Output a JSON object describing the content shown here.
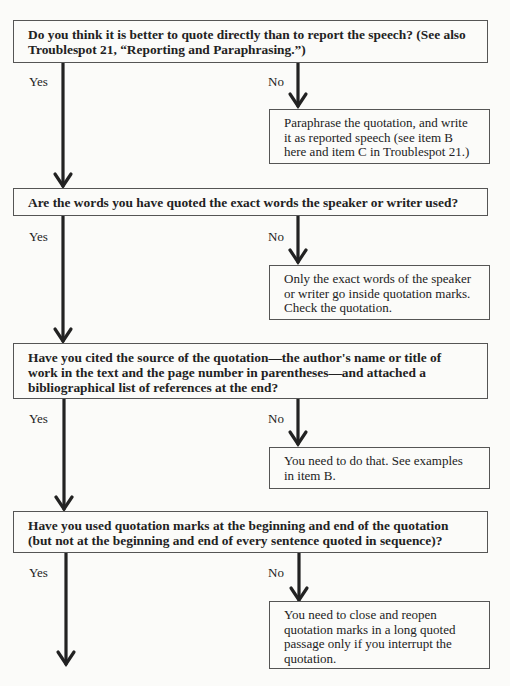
{
  "flowchart": {
    "steps": [
      {
        "question": "Do you think it is better to quote directly than to report the speech? (See also Troublespot 21, “Reporting and Paraphrasing.”)",
        "yes_label": "Yes",
        "no_label": "No",
        "no_action": "Paraphrase the quotation, and write it as reported speech (see item B here and item C in Troublespot 21.)"
      },
      {
        "question": "Are the words you have quoted the exact words the speaker or writer used?",
        "yes_label": "Yes",
        "no_label": "No",
        "no_action": "Only the exact words of the speaker or writer go inside quotation marks. Check the quotation."
      },
      {
        "question": "Have you cited the source of the quotation—the author's name or title of work in the text and the page number in parentheses—and attached a bibliographical list of references at the end?",
        "yes_label": "Yes",
        "no_label": "No",
        "no_action": "You need to do that. See examples in item B."
      },
      {
        "question": "Have you used quotation marks at the beginning and end of the quotation (but not at the beginning and end of every sentence quoted in sequence)?",
        "yes_label": "Yes",
        "no_label": "No",
        "no_action": "You need to close and reopen quotation marks in a long quoted passage only if you interrupt the quotation."
      }
    ]
  }
}
